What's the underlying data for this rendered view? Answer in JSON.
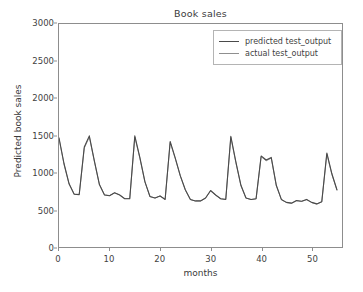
{
  "chart_data": {
    "type": "line",
    "title": "Book sales",
    "xlabel": "months",
    "ylabel": "Predicted book sales",
    "xlim": [
      0,
      56
    ],
    "ylim": [
      0,
      3000
    ],
    "xticks": [
      0,
      10,
      20,
      30,
      40,
      50
    ],
    "yticks": [
      0,
      500,
      1000,
      1500,
      2000,
      2500,
      3000
    ],
    "xtick_labels": [
      "0",
      "10",
      "20",
      "30",
      "40",
      "50"
    ],
    "ytick_labels": [
      "0",
      "500",
      "1000",
      "1500",
      "2000",
      "2500",
      "3000"
    ],
    "grid": false,
    "legend_position": "upper right",
    "x": [
      0,
      1,
      2,
      3,
      4,
      5,
      6,
      7,
      8,
      9,
      10,
      11,
      12,
      13,
      14,
      15,
      16,
      17,
      18,
      19,
      20,
      21,
      22,
      23,
      24,
      25,
      26,
      27,
      28,
      29,
      30,
      31,
      32,
      33,
      34,
      35,
      36,
      37,
      38,
      39,
      40,
      41,
      42,
      43,
      44,
      45,
      46,
      47,
      48,
      49,
      50,
      51,
      52,
      53,
      54,
      55
    ],
    "series": [
      {
        "name": "predicted test_output",
        "color": "#4a4a4a",
        "linewidth": 1.1,
        "values": [
          1470,
          1120,
          850,
          710,
          705,
          1345,
          1495,
          1160,
          840,
          700,
          690,
          730,
          700,
          650,
          650,
          1495,
          1205,
          880,
          680,
          660,
          685,
          640,
          1420,
          1200,
          960,
          770,
          640,
          620,
          620,
          660,
          760,
          700,
          650,
          640,
          1490,
          1145,
          830,
          660,
          640,
          650,
          1225,
          1170,
          1205,
          830,
          640,
          600,
          590,
          625,
          615,
          640,
          600,
          580,
          610,
          1265,
          985,
          770
        ]
      },
      {
        "name": "actual test_output",
        "color": "#8f8f8f",
        "linewidth": 1.0,
        "values": [
          1455,
          1110,
          845,
          712,
          708,
          1330,
          1480,
          1150,
          838,
          702,
          692,
          728,
          702,
          652,
          652,
          1480,
          1195,
          875,
          678,
          658,
          688,
          642,
          1405,
          1190,
          955,
          765,
          638,
          618,
          618,
          658,
          755,
          698,
          648,
          642,
          1475,
          1135,
          825,
          658,
          638,
          648,
          1215,
          1160,
          1195,
          825,
          638,
          598,
          588,
          622,
          612,
          638,
          598,
          578,
          608,
          1250,
          975,
          765
        ]
      }
    ],
    "note": "Seasonal monthly book-sales series; predicted and actual overlap closely"
  },
  "legend": {
    "items": [
      {
        "label": "predicted test_output",
        "color": "#4a4a4a"
      },
      {
        "label": "actual test_output",
        "color": "#8f8f8f"
      }
    ]
  },
  "colors": {
    "predicted": "#4a4a4a",
    "actual": "#8f8f8f",
    "spine": "#8d8d8d",
    "text": "#3a3a3a",
    "background": "#ffffff"
  }
}
